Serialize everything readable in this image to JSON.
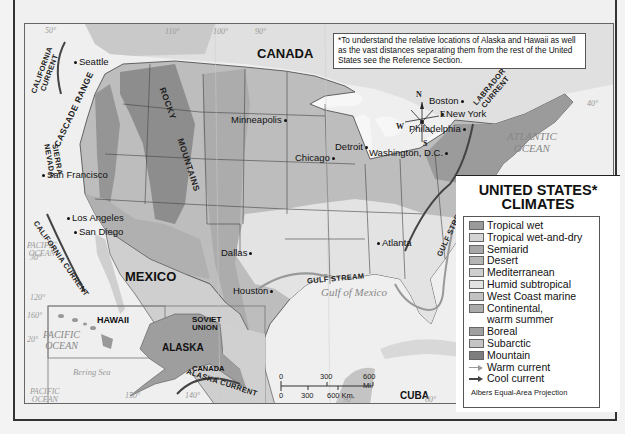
{
  "map": {
    "title": "UNITED STATES* CLIMATES",
    "title_line1": "UNITED STATES*",
    "title_line2": "CLIMATES",
    "note": "*To understand the relative locations of Alaska and Hawaii as well as the vast distances separating them from the rest of the United States see the Reference Section.",
    "projection": "Albers Equal-Area Projection",
    "countries": {
      "canada": "CANADA",
      "mexico": "MEXICO",
      "cuba": "CUBA",
      "canada_inset": "CANADA",
      "soviet_union_1": "SOVIET",
      "soviet_union_2": "UNION",
      "alaska": "ALASKA",
      "hawaii": "HAWAII"
    },
    "cities": {
      "seattle": "Seattle",
      "san_francisco": "San Francisco",
      "los_angeles": "Los Angeles",
      "san_diego": "San Diego",
      "minneapolis": "Minneapolis",
      "chicago": "Chicago",
      "detroit": "Detroit",
      "boston": "Boston",
      "new_york": "New York",
      "philadelphia": "Philadelphia",
      "washington": "Washington, D.C.",
      "atlanta": "Atlanta",
      "dallas": "Dallas",
      "houston": "Houston"
    },
    "waters": {
      "atlantic_1": "ATLANTIC",
      "atlantic_2": "OCEAN",
      "pacific_1": "PACIFIC",
      "pacific_2": "OCEAN",
      "gulf_of_mexico": "Gulf of Mexico",
      "bering_sea": "Bering Sea",
      "hawaii_pacific_1": "PACIFIC",
      "hawaii_pacific_2": "OCEAN",
      "alaska_pacific_1": "PACIFIC",
      "alaska_pacific_2": "OCEAN"
    },
    "currents": {
      "california_top_1": "CALIFORNIA",
      "california_top_2": "CURRENT",
      "california_bottom": "CALIFORNIA CURRENT",
      "labrador_1": "LABRADOR",
      "labrador_2": "CURRENT",
      "gulf_stream_atlantic": "GULF STREAM",
      "gulf_stream_gulf": "GULF STREAM",
      "alaska": "ALASKA CURRENT"
    },
    "ranges": {
      "cascade": "CASCADE RANGE",
      "sierra_1": "SIERRA",
      "sierra_2": "NEVADA",
      "rocky": "ROCKY",
      "mountains": "MOUNTAINS"
    },
    "graticule": {
      "lat_50": "50°",
      "lon_110": "110°",
      "lon_100": "100°",
      "lon_90": "90°",
      "lat_40": "40°",
      "lat_30": "30°",
      "lon_120": "120°",
      "lon_160": "160°",
      "lat_20": "20°",
      "lon_150": "150°",
      "lon_140": "140°",
      "lon_90b": "90°",
      "lon_80": "80°"
    },
    "compass": {
      "n": "N",
      "s": "S",
      "e": "E",
      "w": "W"
    },
    "scale": {
      "mi_0": "0",
      "mi_300": "300",
      "mi_600": "600 Mi.",
      "km_0": "0",
      "km_300": "300",
      "km_600": "600 Km."
    }
  },
  "legend": {
    "items": [
      {
        "label": "Tropical wet",
        "color": "#9a9a9a"
      },
      {
        "label": "Tropical wet-and-dry",
        "color": "#d4d4d4"
      },
      {
        "label": "Semiarid",
        "color": "#a8a8a8"
      },
      {
        "label": "Desert",
        "color": "#b4b4b4"
      },
      {
        "label": "Mediterranean",
        "color": "#cfcfcf"
      },
      {
        "label": "Humid subtropical",
        "color": "#e2e2e2"
      },
      {
        "label": "West Coast marine",
        "color": "#c2c2c2"
      },
      {
        "label": "Continental,",
        "label2": "warm summer",
        "color": "#ababab"
      },
      {
        "label": "Boreal",
        "color": "#a0a0a0"
      },
      {
        "label": "Subarctic",
        "color": "#c4c4c4"
      },
      {
        "label": "Mountain",
        "color": "#7e7e7e"
      }
    ],
    "warm_current": "Warm current",
    "cool_current": "Cool current"
  }
}
